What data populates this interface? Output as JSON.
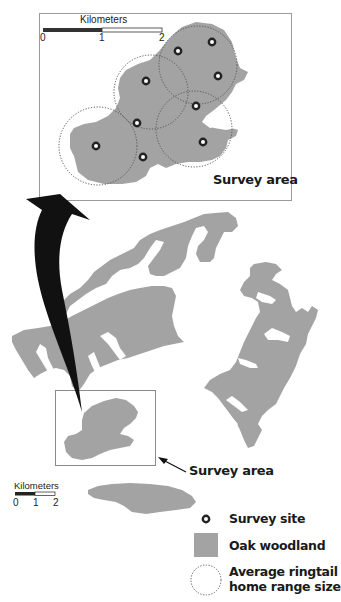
{
  "inset": {
    "scale_bar": {
      "title": "Kilometers",
      "ticks": [
        "0",
        "1",
        "2"
      ]
    },
    "label": "Survey area",
    "survey_sites": [
      {
        "x": 178,
        "y": 51
      },
      {
        "x": 212,
        "y": 42
      },
      {
        "x": 218,
        "y": 76
      },
      {
        "x": 146,
        "y": 81
      },
      {
        "x": 196,
        "y": 106
      },
      {
        "x": 137,
        "y": 123
      },
      {
        "x": 67,
        "y": 146
      },
      {
        "x": 143,
        "y": 157
      },
      {
        "x": 203,
        "y": 142
      }
    ],
    "home_ranges": [
      {
        "cx": 198,
        "cy": 65,
        "r": 39
      },
      {
        "cx": 151,
        "cy": 92,
        "r": 37
      },
      {
        "cx": 194,
        "cy": 129,
        "r": 38
      },
      {
        "cx": 99,
        "cy": 147,
        "r": 39
      }
    ]
  },
  "main_map": {
    "survey_area_label": "Survey area",
    "scale_bar": {
      "title": "Kilometers",
      "ticks": [
        "0",
        "1",
        "2"
      ]
    }
  },
  "legend": {
    "items": [
      {
        "symbol": "survey-site",
        "label": "Survey site"
      },
      {
        "symbol": "oak-woodland",
        "label": "Oak woodland"
      },
      {
        "symbol": "home-range",
        "label_line1": "Average ringtail",
        "label_line2": "home range size"
      }
    ]
  },
  "colors": {
    "woodland": "#a3a3a3",
    "site_ring": "#222222",
    "range_outline": "#555555",
    "frame": "#9a9a9a",
    "arrow": "#111111"
  }
}
